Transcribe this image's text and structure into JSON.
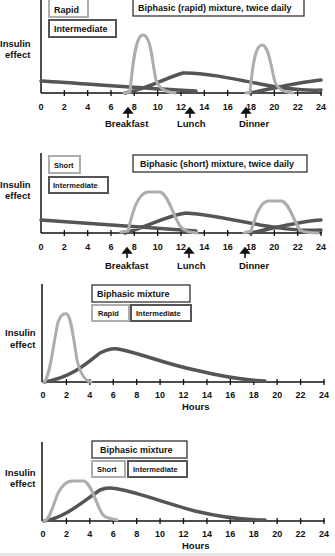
{
  "colors": {
    "rapid": "#adadad",
    "short": "#adadad",
    "intermediate": "#555555",
    "axis": "#111111"
  },
  "chart_data": [
    {
      "type": "line",
      "title": "Biphasic (rapid) mixture, twice daily",
      "ylabel": "Insulin effect",
      "xlabel": "",
      "x_ticks": [
        "0",
        "2",
        "4",
        "6",
        "8",
        "10",
        "12",
        "14",
        "16",
        "18",
        "20",
        "22",
        "24"
      ],
      "xlim": [
        0,
        24
      ],
      "legend": [
        "Rapid",
        "Intermediate"
      ],
      "annotations": [
        {
          "label": "Breakfast",
          "x": 7.5
        },
        {
          "label": "Lunch",
          "x": 13
        },
        {
          "label": "Dinner",
          "x": 17.5
        }
      ],
      "series": [
        {
          "name": "Rapid",
          "x": [
            7.5,
            8,
            8.5,
            9,
            9.5,
            10,
            10.5,
            11,
            11.5,
            17.5,
            18,
            18.5,
            19,
            19.5,
            20,
            20.5,
            21,
            21.5
          ],
          "y": [
            0,
            0.5,
            0.9,
            1.0,
            0.9,
            0.5,
            0.15,
            0.03,
            0,
            0,
            0.5,
            0.9,
            1.0,
            0.9,
            0.5,
            0.15,
            0.03,
            0
          ]
        },
        {
          "name": "Intermediate",
          "x": [
            0,
            4,
            8,
            10,
            12,
            13,
            14,
            16,
            18,
            20,
            22,
            24
          ],
          "y": [
            0.25,
            0.17,
            0.08,
            0.18,
            0.32,
            0.33,
            0.3,
            0.22,
            0.14,
            0.17,
            0.22,
            0.25
          ]
        }
      ],
      "labels": {
        "title": "Biphasic (rapid) mixture, twice daily",
        "legend_a": "Rapid",
        "legend_b": "Intermediate",
        "ylabel_1": "Insulin",
        "ylabel_2": "effect",
        "event_1": "Breakfast",
        "event_2": "Lunch",
        "event_3": "Dinner"
      }
    },
    {
      "type": "line",
      "title": "Biphasic (short) mixture, twice daily",
      "ylabel": "Insulin effect",
      "xlabel": "",
      "x_ticks": [
        "0",
        "2",
        "4",
        "6",
        "8",
        "10",
        "12",
        "14",
        "16",
        "18",
        "20",
        "22",
        "24"
      ],
      "xlim": [
        0,
        24
      ],
      "legend": [
        "Short",
        "Intermediate"
      ],
      "annotations": [
        {
          "label": "Breakfast",
          "x": 7.5
        },
        {
          "label": "Lunch",
          "x": 13
        },
        {
          "label": "Dinner",
          "x": 17.5
        }
      ],
      "series": [
        {
          "name": "Short",
          "x": [
            7,
            8,
            9,
            10,
            11,
            12,
            13,
            13.5,
            17.5,
            18.5,
            19.5,
            20.5,
            21.5,
            22.5,
            23.5
          ],
          "y": [
            0,
            0.3,
            0.85,
            1.0,
            0.95,
            0.5,
            0.05,
            0,
            0,
            0.3,
            0.85,
            0.9,
            0.75,
            0.2,
            0
          ]
        },
        {
          "name": "Intermediate",
          "x": [
            0,
            4,
            8,
            10,
            12,
            13,
            14,
            16,
            18,
            20,
            22,
            24
          ],
          "y": [
            0.45,
            0.35,
            0.15,
            0.35,
            0.55,
            0.57,
            0.52,
            0.4,
            0.28,
            0.3,
            0.4,
            0.45
          ]
        }
      ],
      "labels": {
        "title": "Biphasic (short) mixture, twice daily",
        "legend_a": "Short",
        "legend_b": "Intermediate",
        "ylabel_1": "Insulin",
        "ylabel_2": "effect",
        "event_1": "Breakfast",
        "event_2": "Lunch",
        "event_3": "Dinner"
      }
    },
    {
      "type": "line",
      "title": "Biphasic mixture",
      "ylabel": "Insulin effect",
      "xlabel": "Hours",
      "x_ticks": [
        "0",
        "2",
        "4",
        "6",
        "8",
        "10",
        "12",
        "14",
        "16",
        "18",
        "20",
        "22",
        "24"
      ],
      "xlim": [
        0,
        24
      ],
      "legend": [
        "Rapid",
        "Intermediate"
      ],
      "series": [
        {
          "name": "Rapid",
          "x": [
            0,
            0.5,
            1,
            1.5,
            2,
            2.5,
            3,
            3.5,
            4
          ],
          "y": [
            0,
            0.2,
            0.75,
            0.95,
            1.0,
            0.85,
            0.35,
            0.08,
            0
          ]
        },
        {
          "name": "Intermediate",
          "x": [
            0,
            2,
            4,
            5,
            6,
            7,
            8,
            10,
            12,
            14,
            16,
            18,
            19
          ],
          "y": [
            0,
            0.1,
            0.35,
            0.48,
            0.5,
            0.48,
            0.43,
            0.33,
            0.24,
            0.15,
            0.07,
            0.02,
            0.01
          ]
        }
      ],
      "labels": {
        "title": "Biphasic mixture",
        "legend_a": "Rapid",
        "legend_b": "Intermediate",
        "ylabel_1": "Insulin",
        "ylabel_2": "effect",
        "xlabel": "Hours"
      }
    },
    {
      "type": "line",
      "title": "Biphasic mixture",
      "ylabel": "Insulin effect",
      "xlabel": "Hours",
      "x_ticks": [
        "0",
        "2",
        "4",
        "6",
        "8",
        "10",
        "12",
        "14",
        "16",
        "18",
        "20",
        "22",
        "24"
      ],
      "xlim": [
        0,
        24
      ],
      "legend": [
        "Short",
        "Intermediate"
      ],
      "series": [
        {
          "name": "Short",
          "x": [
            0,
            1,
            1.5,
            2,
            3,
            4,
            5,
            5.5,
            6,
            6.5
          ],
          "y": [
            0,
            0.35,
            0.7,
            0.95,
            1.0,
            0.95,
            0.55,
            0.2,
            0.05,
            0
          ]
        },
        {
          "name": "Intermediate",
          "x": [
            0,
            2,
            4,
            5,
            6,
            7,
            8,
            10,
            12,
            14,
            16,
            18,
            19
          ],
          "y": [
            0,
            0.2,
            0.65,
            0.85,
            0.9,
            0.87,
            0.78,
            0.6,
            0.43,
            0.27,
            0.13,
            0.04,
            0.02
          ]
        }
      ],
      "labels": {
        "title": "Biphasic mixture",
        "legend_a": "Short",
        "legend_b": "Intermediate",
        "ylabel_1": "Insulin",
        "ylabel_2": "effect",
        "xlabel": "Hours"
      }
    }
  ]
}
